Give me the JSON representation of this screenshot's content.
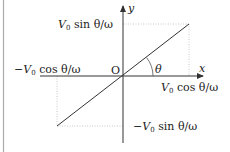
{
  "diagram": {
    "type": "coordinate-plot",
    "colors": {
      "axis": "#333333",
      "line": "#333333",
      "guide": "#bbbbbb",
      "frame": "#aaaaaa",
      "text": "#222222"
    },
    "origin": {
      "x": 123,
      "y": 76,
      "label": "O"
    },
    "axes": {
      "x": {
        "label": "x",
        "from": 40,
        "to": 203
      },
      "y": {
        "label": "y",
        "from": 143,
        "to": 6
      }
    },
    "line": {
      "x1": 57,
      "y1": 126,
      "x2": 189,
      "y2": 24
    },
    "angle": {
      "label": "θ",
      "radius": 30
    },
    "labels": {
      "top_left": {
        "var": "V",
        "sub": "0",
        "rest": " sin θ/ω",
        "sign": ""
      },
      "left": {
        "var": "V",
        "sub": "0",
        "rest": " cos θ/ω",
        "sign": "−"
      },
      "right": {
        "var": "V",
        "sub": "0",
        "rest": " cos θ/ω",
        "sign": ""
      },
      "bottom": {
        "var": "V",
        "sub": "0",
        "rest": " sin θ/ω",
        "sign": "−"
      }
    }
  }
}
